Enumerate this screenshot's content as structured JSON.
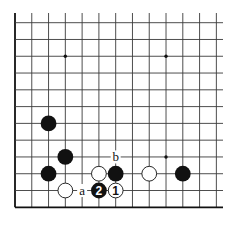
{
  "diagram": {
    "type": "go-board-fragment",
    "grid": {
      "origin_x": 15,
      "origin_y": 22.7,
      "spacing": 16.78,
      "cols": 13,
      "rows": 12,
      "left_edge": true,
      "bottom_edge": true,
      "right_extent": 223,
      "top_extent": 13
    },
    "star_points": [
      {
        "col": 3,
        "row": 2
      },
      {
        "col": 9,
        "row": 2
      },
      {
        "col": 9,
        "row": 8
      }
    ],
    "stones": [
      {
        "color": "black",
        "col": 2,
        "row": 6,
        "label": ""
      },
      {
        "color": "black",
        "col": 3,
        "row": 8,
        "label": ""
      },
      {
        "color": "black",
        "col": 2,
        "row": 9,
        "label": ""
      },
      {
        "color": "white",
        "col": 5,
        "row": 9,
        "label": ""
      },
      {
        "color": "black",
        "col": 6,
        "row": 9,
        "label": ""
      },
      {
        "color": "white",
        "col": 8,
        "row": 9,
        "label": ""
      },
      {
        "color": "black",
        "col": 10,
        "row": 9,
        "label": ""
      },
      {
        "color": "white",
        "col": 3,
        "row": 10,
        "label": ""
      },
      {
        "color": "black",
        "col": 5,
        "row": 10,
        "label": "2"
      },
      {
        "color": "white",
        "col": 6,
        "row": 10,
        "label": "1"
      }
    ],
    "markers": [
      {
        "text": "a",
        "col": 4,
        "row": 10
      },
      {
        "text": "b",
        "col": 6,
        "row": 8
      }
    ],
    "colors": {
      "line": "#3a3a3a",
      "edge": "#111111",
      "black_stone": "#111111",
      "white_stone": "#ffffff",
      "background": "#ffffff"
    }
  }
}
